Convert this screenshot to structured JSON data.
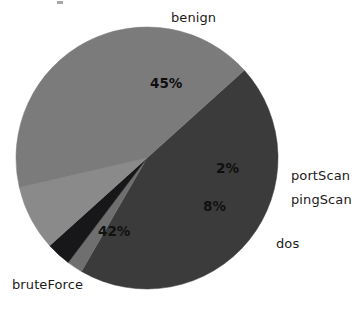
{
  "chart_data": {
    "type": "pie",
    "title": "",
    "xlabel": "",
    "ylabel": "",
    "legend_position": "none",
    "grid": false,
    "labels_outside": true,
    "categories": [
      "benign",
      "portScan",
      "pingScan",
      "dos",
      "bruteForce"
    ],
    "values": [
      45,
      2,
      3,
      8,
      42
    ],
    "value_labels": [
      "45%",
      "2%",
      "",
      "8%",
      "42%"
    ],
    "colors": [
      "#3b3b3b",
      "#6f6f6f",
      "#17171a",
      "#8a8a8a",
      "#7b7b7b"
    ],
    "slices": [
      {
        "name": "benign",
        "label": "benign",
        "value_label": "45%",
        "percent": 45,
        "color": "#3b3b3b",
        "start_angle": -42,
        "end_angle": 120
      },
      {
        "name": "portScan",
        "label": "portScan",
        "value_label": "2%",
        "percent": 2,
        "color": "#6f6f6f",
        "start_angle": 120,
        "end_angle": 127
      },
      {
        "name": "pingScan",
        "label": "pingScan",
        "value_label": "",
        "percent": 3,
        "color": "#17171a",
        "start_angle": 127,
        "end_angle": 138
      },
      {
        "name": "dos",
        "label": "dos",
        "value_label": "8%",
        "percent": 8,
        "color": "#8a8a8a",
        "start_angle": 138,
        "end_angle": 167
      },
      {
        "name": "bruteForce",
        "label": "bruteForce",
        "value_label": "42%",
        "percent": 42,
        "color": "#7b7b7b",
        "start_angle": 167,
        "end_angle": 318
      }
    ],
    "background_color": "#ffffff",
    "text_color": "#1b1b1b"
  },
  "labels": {
    "benign": "benign",
    "port_scan": "portScan",
    "ping_scan": "pingScan",
    "dos": "dos",
    "brute_force": "bruteForce"
  },
  "values": {
    "benign": "45%",
    "port_scan": "2%",
    "dos": "8%",
    "brute_force": "42%"
  }
}
